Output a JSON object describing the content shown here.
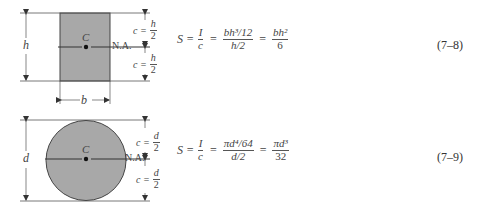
{
  "figures": [
    {
      "shape": "rectangle",
      "labels": {
        "centroid": "C",
        "neutral_axis": "N.A.",
        "height": "h",
        "width": "b",
        "c_top": {
          "lhs": "c =",
          "num": "h",
          "den": "2"
        },
        "c_bottom": {
          "lhs": "c =",
          "num": "h",
          "den": "2"
        }
      },
      "equation": {
        "lhs": "S =",
        "f1": {
          "num": "I",
          "den": "c"
        },
        "eq1": "=",
        "f2": {
          "num": "bh³/12",
          "den": "h/2"
        },
        "eq2": "=",
        "f3": {
          "num": "bh²",
          "den": "6"
        }
      },
      "equation_number": "(7–8)"
    },
    {
      "shape": "circle",
      "labels": {
        "centroid": "C",
        "neutral_axis": "N.A.",
        "diameter": "d",
        "c_top": {
          "lhs": "c =",
          "num": "d",
          "den": "2"
        },
        "c_bottom": {
          "lhs": "c =",
          "num": "d",
          "den": "2"
        }
      },
      "equation": {
        "lhs": "S =",
        "f1": {
          "num": "I",
          "den": "c"
        },
        "eq1": "=",
        "f2": {
          "num": "πd⁴/64",
          "den": "d/2"
        },
        "eq2": "=",
        "f3": {
          "num": "πd³",
          "den": "32"
        }
      },
      "equation_number": "(7–9)"
    }
  ],
  "colors": {
    "section_fill": "#a8a8a8",
    "line": "#444444"
  }
}
